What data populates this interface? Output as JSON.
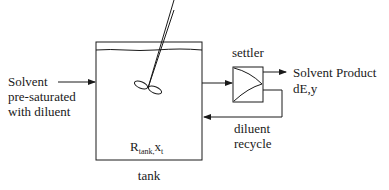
{
  "diagram": {
    "feed": {
      "lines": [
        "Solvent",
        "pre-saturated",
        "with diluent"
      ]
    },
    "tank": {
      "label": "tank",
      "inner_symbol": "R",
      "inner_subscript": "tank,",
      "inner_var": "x",
      "inner_var_subscript": "t"
    },
    "settler": {
      "label": "settler"
    },
    "product": {
      "lines": [
        "Solvent Product",
        "dE,y"
      ]
    },
    "recycle": {
      "lines": [
        "diluent",
        "recycle"
      ]
    },
    "colors": {
      "stroke": "#1a1a1a",
      "background": "#ffffff"
    }
  }
}
